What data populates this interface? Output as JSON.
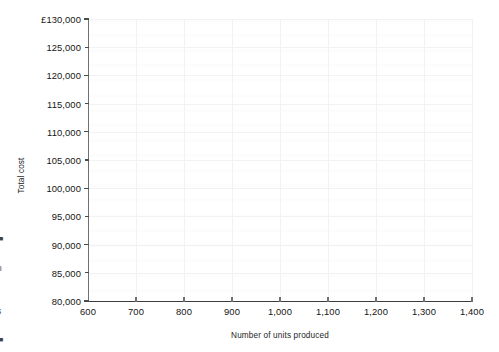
{
  "chart_data": {
    "type": "line",
    "title": "",
    "subtitle": "",
    "xlabel": "Number of units produced",
    "ylabel": "Total cost",
    "xlim": [
      600,
      1400
    ],
    "ylim": [
      80000,
      130000
    ],
    "x_tick_step": 100,
    "y_tick_step": 5000,
    "xticks": [
      600,
      700,
      800,
      900,
      1000,
      1100,
      1200,
      1300,
      1400
    ],
    "yticks": [
      80000,
      85000,
      90000,
      95000,
      100000,
      105000,
      110000,
      115000,
      120000,
      125000,
      130000
    ],
    "xtick_labels": [
      "600",
      "700",
      "800",
      "900",
      "1,000",
      "1,100",
      "1,200",
      "1,300",
      "1,400"
    ],
    "ytick_labels": [
      "80,000",
      "85,000",
      "90,000",
      "95,000",
      "100,000",
      "105,000",
      "110,000",
      "115,000",
      "120,000",
      "125,000",
      "£130,000"
    ],
    "currency_symbol": "£",
    "grid": true,
    "legend": null,
    "series": [],
    "values": [],
    "annotations": [],
    "note": "Blank plotting grid — no data series are drawn in the axes area."
  },
  "margin_fragments": {
    "items": [
      "■",
      ":",
      "n",
      "t",
      "r",
      "s",
      ".",
      "■"
    ]
  },
  "colors": {
    "background": "#ffffff",
    "text": "#141414",
    "axis_line": "#3d3e40",
    "y_axis_line": "#6f7072",
    "gridline": "#f1f2f3",
    "tick": "#4a4b4d"
  }
}
